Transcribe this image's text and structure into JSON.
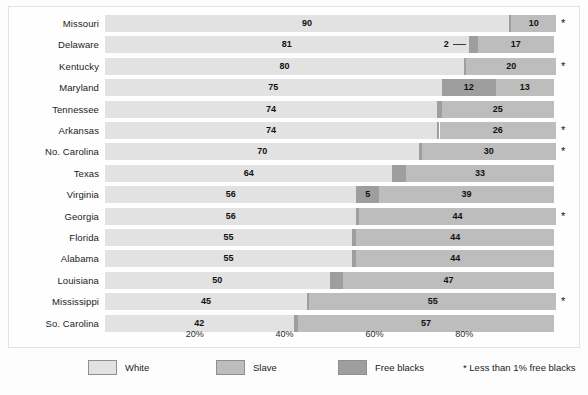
{
  "chart_data": {
    "type": "bar",
    "subtype": "stacked-horizontal-100pct",
    "title": "",
    "xlabel": "",
    "ylabel": "",
    "xlim": [
      0,
      100
    ],
    "grid": false,
    "legend_position": "bottom",
    "categories": [
      "Missouri",
      "Delaware",
      "Kentucky",
      "Maryland",
      "Tennessee",
      "Arkansas",
      "No. Carolina",
      "Texas",
      "Virginia",
      "Georgia",
      "Florida",
      "Alabama",
      "Louisiana",
      "Mississippi",
      "So. Carolina"
    ],
    "series": [
      {
        "name": "White",
        "color": "#e2e2e2",
        "values": [
          90,
          81,
          80,
          75,
          74,
          74,
          70,
          64,
          56,
          56,
          55,
          55,
          50,
          45,
          42
        ]
      },
      {
        "name": "Free blacks",
        "color": "#9e9e9e",
        "values": [
          0.5,
          2,
          0.5,
          12,
          1,
          0.5,
          0.5,
          3,
          5,
          0.5,
          1,
          1,
          3,
          0.5,
          1
        ]
      },
      {
        "name": "Slave",
        "color": "#bdbdbd",
        "values": [
          10,
          17,
          20,
          13,
          25,
          26,
          30,
          33,
          39,
          44,
          44,
          44,
          47,
          55,
          57
        ]
      }
    ],
    "rows": [
      {
        "state": "Missouri",
        "white": 90,
        "white_label": "90",
        "slave": 10,
        "slave_label": "10",
        "free": 0.5,
        "free_label": "",
        "star": "*",
        "callout": false
      },
      {
        "state": "Delaware",
        "white": 81,
        "white_label": "81",
        "slave": 17,
        "slave_label": "17",
        "free": 2,
        "free_label": "2",
        "star": "",
        "callout": true
      },
      {
        "state": "Kentucky",
        "white": 80,
        "white_label": "80",
        "slave": 20,
        "slave_label": "20",
        "free": 0.5,
        "free_label": "",
        "star": "*",
        "callout": false
      },
      {
        "state": "Maryland",
        "white": 75,
        "white_label": "75",
        "slave": 13,
        "slave_label": "13",
        "free": 12,
        "free_label": "12",
        "star": "",
        "callout": false
      },
      {
        "state": "Tennessee",
        "white": 74,
        "white_label": "74",
        "slave": 25,
        "slave_label": "25",
        "free": 1,
        "free_label": "1",
        "star": "",
        "callout": false
      },
      {
        "state": "Arkansas",
        "white": 74,
        "white_label": "74",
        "slave": 26,
        "slave_label": "26",
        "free": 0.5,
        "free_label": "",
        "star": "*",
        "callout": false
      },
      {
        "state": "No. Carolina",
        "white": 70,
        "white_label": "70",
        "slave": 30,
        "slave_label": "30",
        "free": 0.5,
        "free_label": "",
        "star": "*",
        "callout": false
      },
      {
        "state": "Texas",
        "white": 64,
        "white_label": "64",
        "slave": 33,
        "slave_label": "33",
        "free": 3,
        "free_label": "3",
        "star": "",
        "callout": false
      },
      {
        "state": "Virginia",
        "white": 56,
        "white_label": "56",
        "slave": 39,
        "slave_label": "39",
        "free": 5,
        "free_label": "5",
        "star": "",
        "callout": false
      },
      {
        "state": "Georgia",
        "white": 56,
        "white_label": "56",
        "slave": 44,
        "slave_label": "44",
        "free": 0.5,
        "free_label": "",
        "star": "*",
        "callout": false
      },
      {
        "state": "Florida",
        "white": 55,
        "white_label": "55",
        "slave": 44,
        "slave_label": "44",
        "free": 1,
        "free_label": "1",
        "star": "",
        "callout": false
      },
      {
        "state": "Alabama",
        "white": 55,
        "white_label": "55",
        "slave": 44,
        "slave_label": "44",
        "free": 1,
        "free_label": "1",
        "star": "",
        "callout": false
      },
      {
        "state": "Louisiana",
        "white": 50,
        "white_label": "50",
        "slave": 47,
        "slave_label": "47",
        "free": 3,
        "free_label": "3",
        "star": "",
        "callout": false
      },
      {
        "state": "Mississippi",
        "white": 45,
        "white_label": "45",
        "slave": 55,
        "slave_label": "55",
        "free": 0.5,
        "free_label": "",
        "star": "*",
        "callout": false
      },
      {
        "state": "So. Carolina",
        "white": 42,
        "white_label": "42",
        "slave": 57,
        "slave_label": "57",
        "free": 1,
        "free_label": "1",
        "star": "",
        "callout": false
      }
    ],
    "xticks": [
      {
        "value": 20,
        "label": "20%"
      },
      {
        "value": 40,
        "label": "40%"
      },
      {
        "value": 60,
        "label": "60%"
      },
      {
        "value": 80,
        "label": "80%"
      }
    ],
    "legend": [
      {
        "label": "White",
        "color": "#e2e2e2"
      },
      {
        "label": "Slave",
        "color": "#bdbdbd"
      },
      {
        "label": "Free blacks",
        "color": "#9e9e9e"
      }
    ],
    "footnote": "* Less than 1% free blacks",
    "footnote_marker": "*"
  },
  "colors": {
    "white_segment": "#e2e2e2",
    "slave_segment": "#bdbdbd",
    "free_segment": "#9e9e9e",
    "text": "#1b1b1b",
    "panel_border": "#e3e3e3",
    "background": "#fdfdfd"
  }
}
